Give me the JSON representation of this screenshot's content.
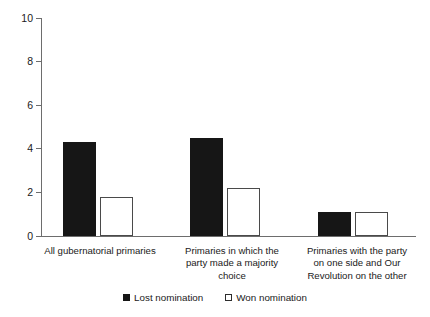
{
  "chart_data": {
    "type": "bar",
    "title": "",
    "subtitle": "",
    "xlabel": "",
    "ylabel": "",
    "ylim": [
      0,
      10
    ],
    "yticks": [
      0,
      2,
      4,
      6,
      8,
      10
    ],
    "ytick_labels": [
      "0",
      "2",
      "4",
      "6",
      "8",
      "10"
    ],
    "grid": false,
    "legend_position": "bottom",
    "categories": [
      "All gubernatorial primaries",
      "Primaries in which the party made a majority choice",
      "Primaries with the party on one side and Our Revolution on the other"
    ],
    "category_lines": [
      [
        "All gubernatorial primaries"
      ],
      [
        "Primaries in which the",
        "party made a majority",
        "choice"
      ],
      [
        "Primaries with the party",
        "on one side and Our",
        "Revolution on the other"
      ]
    ],
    "series": [
      {
        "name": "Lost nomination",
        "color": "#161616",
        "fill": "solid",
        "values": [
          4.3,
          4.5,
          1.1
        ]
      },
      {
        "name": "Won nomination",
        "color": "#ffffff",
        "fill": "outline",
        "values": [
          1.8,
          2.2,
          1.1
        ]
      }
    ]
  },
  "legend": {
    "items": [
      {
        "label": "Lost nomination",
        "style": "lost"
      },
      {
        "label": "Won nomination",
        "style": "won"
      }
    ]
  },
  "axis": {
    "y_labels": {
      "t0": "0",
      "t2": "2",
      "t4": "4",
      "t6": "6",
      "t8": "8",
      "t10": "10"
    }
  },
  "categories_text": {
    "c0_l0": "All gubernatorial primaries",
    "c1_l0": "Primaries in which the",
    "c1_l1": "party made a majority",
    "c1_l2": "choice",
    "c2_l0": "Primaries with the party",
    "c2_l1": "on one side and Our",
    "c2_l2": "Revolution on the other"
  }
}
